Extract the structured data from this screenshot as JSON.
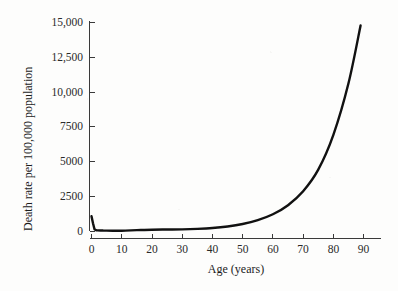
{
  "chart_data": {
    "type": "line",
    "title": "",
    "xlabel": "Age (years)",
    "ylabel": "Death rate per 100,000 population",
    "xlim": [
      0,
      90
    ],
    "ylim": [
      0,
      15000
    ],
    "grid": false,
    "legend": false,
    "xticks": [
      0,
      10,
      20,
      30,
      40,
      50,
      60,
      70,
      80,
      90
    ],
    "xtick_labels": [
      "0",
      "10",
      "20",
      "30",
      "40",
      "50",
      "60",
      "70",
      "80",
      "90"
    ],
    "yticks": [
      0,
      2500,
      5000,
      7500,
      10000,
      12500,
      15000
    ],
    "ytick_labels": [
      "0",
      "2500",
      "5000",
      "7500",
      "10,000",
      "12,500",
      "15,000"
    ],
    "series": [
      {
        "name": "Death rate",
        "x": [
          0,
          0.5,
          1,
          1.5,
          2,
          3,
          4,
          5,
          7,
          10,
          15,
          20,
          25,
          30,
          35,
          40,
          45,
          50,
          55,
          60,
          65,
          70,
          75,
          80,
          85,
          89
        ],
        "values": [
          1060,
          560,
          130,
          55,
          45,
          35,
          30,
          25,
          22,
          22,
          60,
          95,
          105,
          115,
          150,
          210,
          320,
          500,
          780,
          1200,
          1850,
          2850,
          4400,
          6900,
          10600,
          14750
        ]
      }
    ],
    "curve_note": "Infant mortality spike at age 0 falling sharply by age 2, flat trough through age 35, then exponential (Gompertz) rise to ~14,750 at age 89"
  },
  "axis": {
    "x_title": "Age (years)",
    "y_title": "Death rate per 100,000 population"
  }
}
